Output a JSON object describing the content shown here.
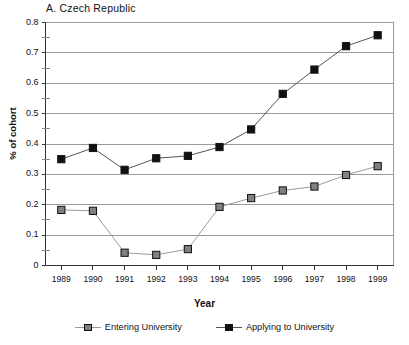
{
  "chart_data": {
    "type": "line",
    "title": "A.  Czech Republic",
    "xlabel": "Year",
    "ylabel": "% of cohort",
    "categories": [
      "1989",
      "1990",
      "1991",
      "1992",
      "1993",
      "1994",
      "1995",
      "1996",
      "1997",
      "1998",
      "1999"
    ],
    "x": [
      1989,
      1990,
      1991,
      1992,
      1993,
      1994,
      1995,
      1996,
      1997,
      1998,
      1999
    ],
    "ylim": [
      0,
      0.8
    ],
    "ytick_labels": [
      "0",
      "0.1",
      "0.2",
      "0.3",
      "0.4",
      "0.5",
      "0.6",
      "0.7",
      "0.8"
    ],
    "ytick_values": [
      0,
      0.1,
      0.2,
      0.3,
      0.4,
      0.5,
      0.6,
      0.7,
      0.8
    ],
    "ytick_minor_values": [
      0.05,
      0.15,
      0.25,
      0.35,
      0.45,
      0.55,
      0.65,
      0.75
    ],
    "grid": "horizontal",
    "legend_position": "bottom",
    "series": [
      {
        "name": "Entering University",
        "color": "#808080",
        "marker": "square",
        "values": [
          0.183,
          0.18,
          0.042,
          0.035,
          0.054,
          0.193,
          0.222,
          0.247,
          0.26,
          0.298,
          0.327
        ]
      },
      {
        "name": "Applying to University",
        "color": "#111111",
        "marker": "square",
        "values": [
          0.35,
          0.387,
          0.315,
          0.353,
          0.361,
          0.39,
          0.448,
          0.565,
          0.645,
          0.722,
          0.758
        ]
      }
    ]
  },
  "axis_colors": {
    "gridline": "#9a9a9a",
    "axis": "#333333"
  }
}
